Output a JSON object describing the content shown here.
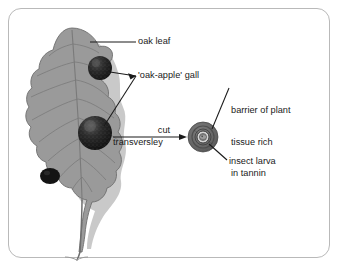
{
  "figure": {
    "background_color": "#ffffff",
    "frame_color": "#b9b9b9"
  },
  "colors": {
    "leaf_fill": "#9a9a9a",
    "leaf_outline": "#6e6e6e",
    "leaf_vein": "#7a7a7a",
    "leaf_shadow": "#c9c9c9",
    "gall_dark": "#1e1e1e",
    "gall_speckle": "#6a6a6a",
    "section_outer": "#6b6b6b",
    "section_ring": "#4f4f4f",
    "section_inner": "#cfcfcf",
    "larva": "#8f8f8f",
    "leader_line": "#1a1a1a",
    "text": "#1a1a1a"
  },
  "labels": {
    "oak_leaf": "oak leaf",
    "gall": "'oak-apple' gall",
    "cut": "cut",
    "transversley": "transversley",
    "barrier_line1": "barrier of plant",
    "barrier_line2": "tissue rich",
    "barrier_line3": "in tannin",
    "insect_larva": "insect larva"
  },
  "parts": {
    "leaf": "oak-leaf",
    "galls": [
      {
        "name": "gall-upper",
        "cx": 100,
        "cy": 68,
        "r": 12
      },
      {
        "name": "gall-middle",
        "cx": 95,
        "cy": 133,
        "r": 17
      },
      {
        "name": "gall-lower-partial",
        "cx": 50,
        "cy": 176,
        "r": 9
      }
    ],
    "cross_section": {
      "name": "gall-cross-section",
      "cx": 203,
      "cy": 137,
      "r": 15
    },
    "arrow": {
      "name": "cut-transversely-arrow",
      "from_x": 113,
      "from_y": 137,
      "to_x": 186,
      "to_y": 137
    }
  }
}
